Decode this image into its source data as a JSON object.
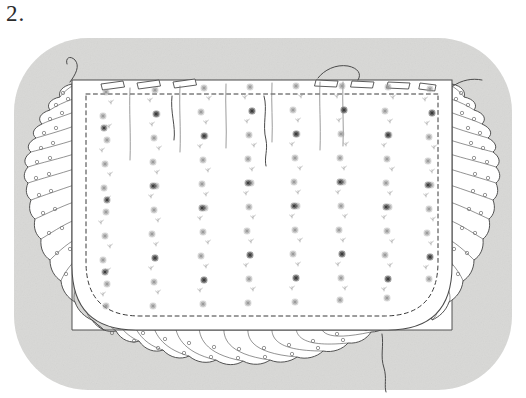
{
  "figure": {
    "number_label": "2.",
    "caption": ""
  },
  "canvas": {
    "width": 526,
    "height": 398,
    "paper_color": "#ffffff"
  },
  "backdrop": {
    "name": "gray-rounded-backdrop",
    "fill": "#d7d7d5",
    "x": 14,
    "y": 38,
    "width": 498,
    "height": 352,
    "corner_radius": 74
  },
  "artwork": {
    "title": "Embroidered ruffled apron panel",
    "subject": "flat-lay textile illustration",
    "medium": "pen-and-ink line drawing with halftone embroidery",
    "fabric_color": "#ffffff",
    "ink_color": "#4a4a4a",
    "embroidery_color": "#9a9a9a",
    "embroidery_accent_color": "#3c3c3c",
    "panel": {
      "name": "main-fabric-panel",
      "left": 72,
      "top": 80,
      "right": 452,
      "bottom": 330,
      "bottom_corner_radius": 70
    },
    "ruffle": {
      "name": "gathered-ruffle-trim",
      "depth": 34,
      "pattern": "polka dot",
      "dot_color": "#6e6e6e",
      "scallop_count_left": 9,
      "scallop_count_bottom": 15,
      "scallop_count_right": 9,
      "edges": [
        "left",
        "bottom",
        "right"
      ]
    },
    "stitch_line": {
      "name": "dashed-stitch-line",
      "style": "dashed",
      "color": "#3a3a3a"
    },
    "top_edge": {
      "name": "pleated-top-edge",
      "tuck_count": 7,
      "description": "folded tucks along upper hem"
    },
    "floral_stripes": {
      "name": "floral-garland-stripes",
      "count": 8,
      "x_positions": [
        106,
        155,
        204,
        250,
        296,
        342,
        388,
        430
      ],
      "motif": "sprigged star flowers in vertical garlands"
    },
    "fold_lines": {
      "name": "fabric-crease-lines",
      "count": 5,
      "x_positions": [
        130,
        180,
        226,
        272,
        320
      ]
    },
    "loose_threads": {
      "name": "loose-thread-strands",
      "count": 4,
      "positions": [
        "top-left",
        "top-right",
        "bottom-center",
        "mid-right"
      ]
    }
  }
}
